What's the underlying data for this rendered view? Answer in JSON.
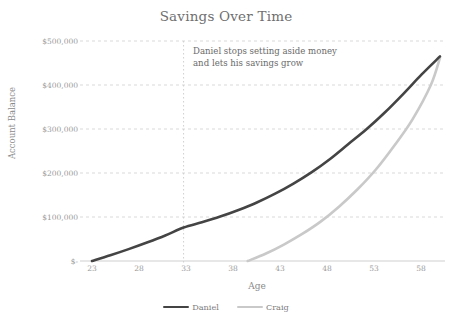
{
  "chart_data": {
    "type": "line",
    "title": "Savings Over Time",
    "xlabel": "Age",
    "ylabel": "Account Balance",
    "xlim": [
      23,
      61
    ],
    "ylim": [
      0,
      500000
    ],
    "grid": true,
    "legend_position": "bottom",
    "x_ticks": [
      "23",
      "28",
      "33",
      "38",
      "43",
      "48",
      "53",
      "58"
    ],
    "x_tick_values": [
      23,
      28,
      33,
      38,
      43,
      48,
      53,
      58
    ],
    "y_ticks": [
      "$-",
      "$100,000",
      "$200,000",
      "$300,000",
      "$400,000",
      "$500,000"
    ],
    "y_tick_values": [
      0,
      100000,
      200000,
      300000,
      400000,
      500000
    ],
    "series": [
      {
        "name": "Daniel",
        "color": "#444444",
        "x": [
          23,
          25,
          27,
          29,
          31,
          33,
          35,
          37,
          39,
          41,
          43,
          45,
          47,
          49,
          51,
          53,
          55,
          57,
          59,
          61
        ],
        "values": [
          0,
          13000,
          27000,
          42000,
          58000,
          76000,
          88000,
          101000,
          116000,
          133000,
          153000,
          176000,
          202000,
          232000,
          266000,
          300000,
          338000,
          380000,
          424000,
          465000
        ]
      },
      {
        "name": "Craig",
        "color": "#c9c9c9",
        "x": [
          40,
          42,
          44,
          46,
          48,
          50,
          52,
          54,
          56,
          58,
          60,
          61
        ],
        "values": [
          0,
          17000,
          38000,
          62000,
          90000,
          124000,
          163000,
          208000,
          262000,
          322000,
          400000,
          462000
        ]
      }
    ],
    "annotations": [
      {
        "name": "daniel-stops-note",
        "text": "Daniel stops setting aside money\nand lets his savings grow",
        "line1": "Daniel stops setting aside money",
        "line2": "and lets his savings grow",
        "marker_x": 33,
        "marker_type": "vertical-dotted-line",
        "marker_color": "#d0d0d0"
      }
    ],
    "colors": {
      "background": "#ffffff",
      "grid": "#d9d9d9",
      "axis": "#cfcfcf",
      "text": "#7d7d7d",
      "title": "#6f6f6f"
    }
  },
  "legend": {
    "items": [
      {
        "label": "Daniel",
        "color": "#444444"
      },
      {
        "label": "Craig",
        "color": "#c9c9c9"
      }
    ]
  }
}
